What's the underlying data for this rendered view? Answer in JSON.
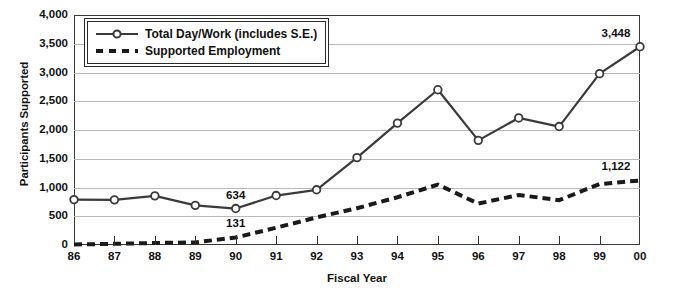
{
  "chart_data": {
    "type": "line",
    "title": "",
    "xlabel": "Fiscal Year",
    "ylabel": "Participants Supported",
    "categories": [
      "86",
      "87",
      "88",
      "89",
      "90",
      "91",
      "92",
      "93",
      "94",
      "95",
      "96",
      "97",
      "98",
      "99",
      "00"
    ],
    "x": [
      1986,
      1987,
      1988,
      1989,
      1990,
      1991,
      1992,
      1993,
      1994,
      1995,
      1996,
      1997,
      1998,
      1999,
      2000
    ],
    "ylim": [
      0,
      4000
    ],
    "ytick_labels": [
      "0",
      "500",
      "1,000",
      "1,500",
      "2,000",
      "2,500",
      "3,000",
      "3,500",
      "4,000"
    ],
    "ytick_values": [
      0,
      500,
      1000,
      1500,
      2000,
      2500,
      3000,
      3500,
      4000
    ],
    "grid": "horizontal",
    "legend_position": "top-left",
    "series": [
      {
        "name": "Total Day/Work (includes S.E.)",
        "style": "solid-with-open-circle-markers",
        "color": "#3a3a3a",
        "values": [
          790,
          785,
          855,
          690,
          634,
          860,
          960,
          1520,
          2120,
          2700,
          1820,
          2210,
          2060,
          2980,
          3448
        ]
      },
      {
        "name": "Supported Employment",
        "style": "dashed",
        "color": "#1a1a1a",
        "values": [
          10,
          20,
          35,
          45,
          131,
          300,
          480,
          640,
          830,
          1050,
          720,
          870,
          780,
          1060,
          1122
        ]
      }
    ],
    "annotations": [
      {
        "label": "634",
        "series": "Total Day/Work (includes S.E.)",
        "category": "90",
        "value": 634
      },
      {
        "label": "131",
        "series": "Supported Employment",
        "category": "90",
        "value": 131
      },
      {
        "label": "3,448",
        "series": "Total Day/Work (includes S.E.)",
        "category": "00",
        "value": 3448
      },
      {
        "label": "1,122",
        "series": "Supported Employment",
        "category": "00",
        "value": 1122
      }
    ]
  },
  "legend": {
    "items": [
      {
        "label": "Total Day/Work (includes S.E.)",
        "marker": "line-open-circle-icon"
      },
      {
        "label": "Supported Employment",
        "marker": "dashed-line-icon"
      }
    ]
  }
}
